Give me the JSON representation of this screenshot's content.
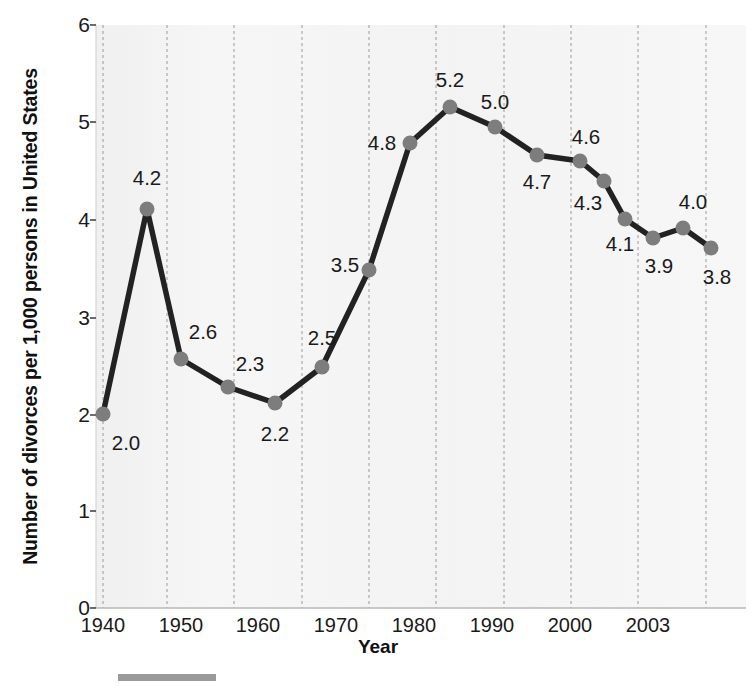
{
  "chart_data": {
    "type": "line",
    "title": "",
    "xlabel": "Year",
    "ylabel": "Number of divorces per 1,000 persons in United States",
    "x": [
      1940,
      1945,
      1950,
      1955,
      1960,
      1965,
      1970,
      1975,
      1980,
      1985,
      1990,
      1996,
      1998,
      2000,
      2002,
      2003,
      2003
    ],
    "categories": [
      "1940",
      "1945",
      "1950",
      "1955",
      "1960",
      "1965",
      "1970",
      "1975",
      "1980",
      "1985",
      "1990",
      "1996",
      "1998",
      "2000",
      "2002",
      "2003",
      "2003"
    ],
    "values": [
      2.0,
      4.2,
      2.6,
      2.3,
      2.2,
      2.5,
      3.5,
      4.8,
      5.2,
      5.0,
      4.7,
      4.6,
      4.3,
      4.1,
      3.9,
      4.0,
      3.8
    ],
    "point_labels": [
      "2.0",
      "4.2",
      "2.6",
      "2.3",
      "2.2",
      "2.5",
      "3.5",
      "4.8",
      "5.2",
      "5.0",
      "4.7",
      "4.6",
      "4.3",
      "4.1",
      "3.9",
      "4.0",
      "3.8"
    ],
    "ylim": [
      0,
      6
    ],
    "xlim": [
      1940,
      2006
    ],
    "y_ticks": [
      "6",
      "5",
      "4",
      "3",
      "2",
      "1",
      "0"
    ],
    "x_ticks": [
      "1940",
      "1950",
      "1960",
      "1970",
      "1980",
      "1990",
      "2000",
      "2003"
    ],
    "grid": "vertical-dashed",
    "legend": "none",
    "line_color": "#222222",
    "marker_color": "#7d7d7d",
    "plot_background": "#f4f4f4"
  },
  "axes": {
    "y_title": "Number of divorces per 1,000 persons in United States",
    "x_title": "Year",
    "y_tick_labels": [
      {
        "text": "6",
        "top": 14
      },
      {
        "text": "5",
        "top": 111
      },
      {
        "text": "4",
        "top": 209
      },
      {
        "text": "3",
        "top": 307
      },
      {
        "text": "2",
        "top": 404
      },
      {
        "text": "1",
        "top": 500
      },
      {
        "text": "0",
        "top": 597
      }
    ],
    "x_tick_labels": [
      {
        "text": "1940",
        "left": 103
      },
      {
        "text": "1950",
        "left": 181
      },
      {
        "text": "1960",
        "left": 258
      },
      {
        "text": "1970",
        "left": 336
      },
      {
        "text": "1980",
        "left": 414
      },
      {
        "text": "1990",
        "left": 492
      },
      {
        "text": "2000",
        "left": 570
      },
      {
        "text": "2003",
        "left": 648
      }
    ]
  },
  "series_points": [
    {
      "label": "2.0",
      "year": "1940",
      "value": "2.0",
      "cx": 103,
      "cy": 414,
      "lx": 126,
      "ly": 443
    },
    {
      "label": "4.2",
      "year": "1945",
      "value": "4.2",
      "cx": 147,
      "cy": 209,
      "lx": 147,
      "ly": 178
    },
    {
      "label": "2.6",
      "year": "1950",
      "value": "2.6",
      "cx": 181,
      "cy": 359,
      "lx": 203,
      "ly": 332
    },
    {
      "label": "2.3",
      "year": "1955",
      "value": "2.3",
      "cx": 228,
      "cy": 387,
      "lx": 250,
      "ly": 364
    },
    {
      "label": "2.2",
      "year": "1960",
      "value": "2.2",
      "cx": 275,
      "cy": 403,
      "lx": 275,
      "ly": 434
    },
    {
      "label": "2.5",
      "year": "1965",
      "value": "2.5",
      "cx": 322,
      "cy": 367,
      "lx": 322,
      "ly": 338
    },
    {
      "label": "3.5",
      "year": "1970",
      "value": "3.5",
      "cx": 369,
      "cy": 270,
      "lx": 345,
      "ly": 265
    },
    {
      "label": "4.8",
      "year": "1975",
      "value": "4.8",
      "cx": 410,
      "cy": 143,
      "lx": 382,
      "ly": 143
    },
    {
      "label": "5.2",
      "year": "1980",
      "value": "5.2",
      "cx": 450,
      "cy": 107,
      "lx": 450,
      "ly": 80
    },
    {
      "label": "5.0",
      "year": "1985",
      "value": "5.0",
      "cx": 495,
      "cy": 127,
      "lx": 495,
      "ly": 102
    },
    {
      "label": "4.7",
      "year": "1990",
      "value": "4.7",
      "cx": 537,
      "cy": 155,
      "lx": 537,
      "ly": 182
    },
    {
      "label": "4.6",
      "year": "1996",
      "value": "4.6",
      "cx": 580,
      "cy": 161,
      "lx": 586,
      "ly": 137
    },
    {
      "label": "4.3",
      "year": "1998",
      "value": "4.3",
      "cx": 604,
      "cy": 181,
      "lx": 588,
      "ly": 203
    },
    {
      "label": "4.1",
      "year": "2000",
      "value": "4.1",
      "cx": 625,
      "cy": 219,
      "lx": 620,
      "ly": 244
    },
    {
      "label": "3.9",
      "year": "2002",
      "value": "3.9",
      "cx": 653,
      "cy": 238,
      "lx": 659,
      "ly": 266
    },
    {
      "label": "4.0",
      "year": "2003",
      "value": "4.0",
      "cx": 683,
      "cy": 228,
      "lx": 693,
      "ly": 202
    },
    {
      "label": "3.8",
      "year": "2003",
      "value": "3.8",
      "cx": 711,
      "cy": 248,
      "lx": 717,
      "ly": 277
    }
  ],
  "gridlines_x": [
    103,
    167,
    234,
    302,
    369,
    436,
    504,
    571,
    638,
    706
  ]
}
